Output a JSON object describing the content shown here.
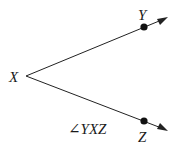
{
  "diagram": {
    "vertex": {
      "label": "X",
      "x": 26,
      "y": 76
    },
    "points": [
      {
        "label": "Y",
        "x": 144,
        "y": 27
      },
      {
        "label": "Z",
        "x": 144,
        "y": 121
      }
    ],
    "caption": "∠YXZ",
    "colors": {
      "line": "#222222",
      "point": "#111111",
      "text": "#1a1a1a"
    }
  }
}
